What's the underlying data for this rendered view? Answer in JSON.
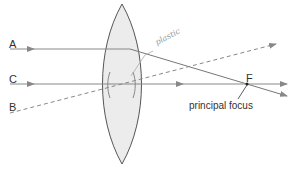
{
  "diagram": {
    "rays": [
      {
        "id": "A",
        "label": "A",
        "type": "solid"
      },
      {
        "id": "C",
        "label": "C",
        "type": "solid"
      },
      {
        "id": "B",
        "label": "B",
        "type": "dashed"
      }
    ],
    "focus": {
      "label": "F",
      "caption": "principal focus"
    },
    "annotation": "plastic",
    "colors": {
      "line": "#777777",
      "lens_fill": "#ececec",
      "lens_stroke": "#555555"
    }
  }
}
